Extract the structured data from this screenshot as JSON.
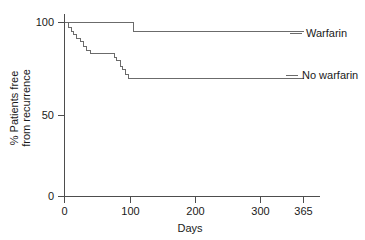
{
  "chart_data": {
    "type": "line",
    "subtype": "kaplan-meier-step",
    "title": "",
    "xlabel": "Days",
    "ylabel_line1": "% Patients free",
    "ylabel_line2": "from recurrence",
    "xlim": [
      0,
      395
    ],
    "ylim": [
      0,
      108
    ],
    "grid": false,
    "legend_position": "right-inline",
    "x_ticks": [
      0,
      100,
      200,
      300,
      365
    ],
    "x_tick_labels": [
      "0",
      "100",
      "200",
      "300",
      "365"
    ],
    "y_ticks": [
      0,
      50,
      100
    ],
    "y_tick_labels": [
      "0",
      "50",
      "100"
    ],
    "series": [
      {
        "name": "Warfarin",
        "label": "Warfarin",
        "color": "#6b6b6b",
        "x": [
          0,
          105,
          105,
          365
        ],
        "values": [
          100,
          100,
          95,
          95
        ],
        "steps": [
          {
            "day": 0,
            "percent": 100
          },
          {
            "day": 105,
            "percent": 95
          },
          {
            "day": 365,
            "percent": 95
          }
        ]
      },
      {
        "name": "No warfarin",
        "label": "No warfarin",
        "color": "#6b6b6b",
        "steps": [
          {
            "day": 0,
            "percent": 100
          },
          {
            "day": 6,
            "percent": 97
          },
          {
            "day": 10,
            "percent": 95
          },
          {
            "day": 14,
            "percent": 93
          },
          {
            "day": 19,
            "percent": 91
          },
          {
            "day": 24,
            "percent": 89
          },
          {
            "day": 29,
            "percent": 86
          },
          {
            "day": 34,
            "percent": 84
          },
          {
            "day": 40,
            "percent": 82
          },
          {
            "day": 72,
            "percent": 82
          },
          {
            "day": 76,
            "percent": 80
          },
          {
            "day": 80,
            "percent": 78
          },
          {
            "day": 85,
            "percent": 75
          },
          {
            "day": 89,
            "percent": 73
          },
          {
            "day": 93,
            "percent": 70
          },
          {
            "day": 97,
            "percent": 68
          },
          {
            "day": 365,
            "percent": 68
          }
        ]
      }
    ]
  },
  "legend": {
    "warfarin_label": "Warfarin",
    "no_warfarin_label": "No warfarin"
  },
  "axes": {
    "x_title": "Days",
    "y_title_line1": "% Patients free",
    "y_title_line2": "from recurrence",
    "x_tick_0": "0",
    "x_tick_100": "100",
    "x_tick_200": "200",
    "x_tick_300": "300",
    "x_tick_365": "365",
    "y_tick_0": "0",
    "y_tick_50": "50",
    "y_tick_100": "100"
  }
}
